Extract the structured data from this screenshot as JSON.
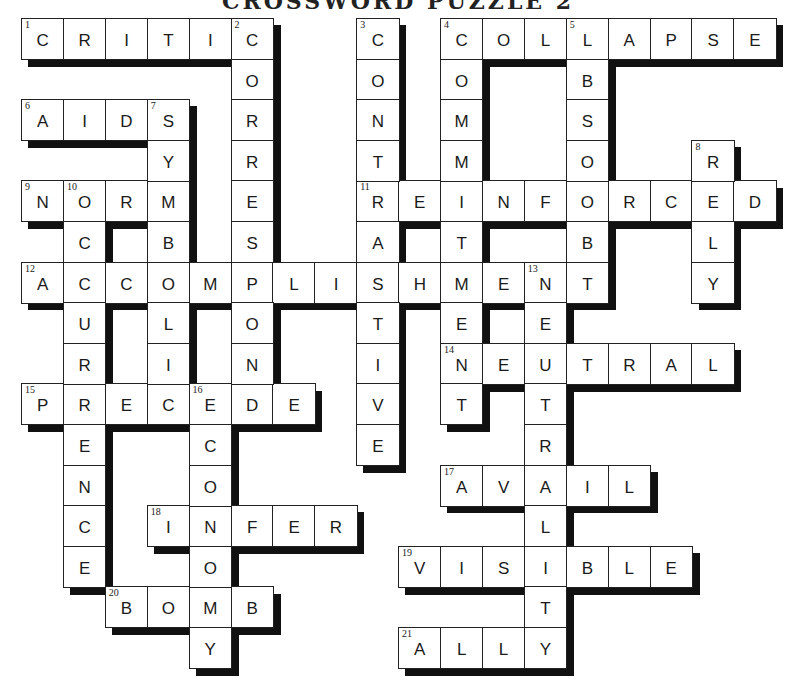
{
  "title": "CROSSWORD PUZZLE 2",
  "grid": {
    "origin_x": 21,
    "origin_y": 18,
    "cell_w": 41.9,
    "cell_h": 40.6,
    "shadow_px": 8
  },
  "colors": {
    "cell_bg": "#ffffff",
    "border": "#222222",
    "shadow": "#111111",
    "text": "#1a1a1a"
  },
  "across": [
    {
      "number": 1,
      "answer": "CRITIC",
      "row": 0,
      "col": 0
    },
    {
      "number": 4,
      "answer": "COLLAPSE",
      "row": 0,
      "col": 10
    },
    {
      "number": 6,
      "answer": "AIDS",
      "row": 2,
      "col": 0
    },
    {
      "number": 9,
      "answer": "NORM",
      "row": 4,
      "col": 0
    },
    {
      "number": 11,
      "answer": "REINFORCED",
      "row": 4,
      "col": 8
    },
    {
      "number": 12,
      "answer": "ACCOMPLISHMENT",
      "row": 6,
      "col": 0
    },
    {
      "number": 14,
      "answer": "NEUTRAL",
      "row": 8,
      "col": 10
    },
    {
      "number": 15,
      "answer": "PRECEDE",
      "row": 9,
      "col": 0
    },
    {
      "number": 17,
      "answer": "AVAIL",
      "row": 11,
      "col": 10
    },
    {
      "number": 18,
      "answer": "INFER",
      "row": 12,
      "col": 3
    },
    {
      "number": 19,
      "answer": "VISIBLE",
      "row": 13,
      "col": 9
    },
    {
      "number": 20,
      "answer": "BOMB",
      "row": 14,
      "col": 2
    },
    {
      "number": 21,
      "answer": "ALLY",
      "row": 15,
      "col": 9
    }
  ],
  "down": [
    {
      "number": 2,
      "answer": "CORRESPOND",
      "row": 0,
      "col": 5
    },
    {
      "number": 3,
      "answer": "CONTRASTIVE",
      "row": 0,
      "col": 8
    },
    {
      "number": 4,
      "answer": "COMMITMENT",
      "row": 0,
      "col": 10
    },
    {
      "number": 5,
      "answer": "ABSORB",
      "row": 0,
      "col": 13
    },
    {
      "number": 7,
      "answer": "SYMBOLIC",
      "row": 2,
      "col": 3
    },
    {
      "number": 8,
      "answer": "RELY",
      "row": 3,
      "col": 16
    },
    {
      "number": 10,
      "answer": "OCCURRENCE",
      "row": 4,
      "col": 1
    },
    {
      "number": 13,
      "answer": "NEUTRALITY",
      "row": 6,
      "col": 12
    },
    {
      "number": 16,
      "answer": "ECONOMY",
      "row": 9,
      "col": 4
    }
  ]
}
